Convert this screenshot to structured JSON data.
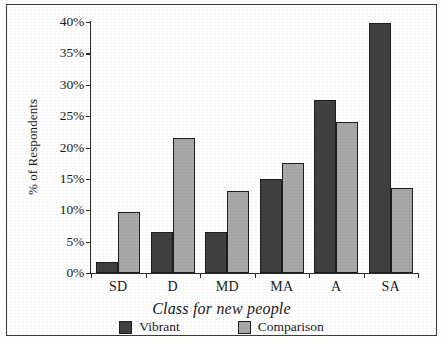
{
  "chart_data": {
    "type": "bar",
    "title": "",
    "xlabel": "Class for new people",
    "ylabel": "% of Respondents",
    "categories": [
      "SD",
      "D",
      "MD",
      "MA",
      "A",
      "SA"
    ],
    "series": [
      {
        "name": "Vibrant",
        "color": "#404040",
        "values": [
          1.8,
          6.5,
          6.5,
          15.0,
          27.6,
          39.8
        ]
      },
      {
        "name": "Comparison",
        "color": "#a8a8a8",
        "values": [
          9.7,
          21.5,
          13.0,
          17.5,
          24.1,
          13.6
        ]
      }
    ],
    "ylim": [
      0,
      40
    ],
    "ytick_values": [
      0,
      5,
      10,
      15,
      20,
      25,
      30,
      35,
      40
    ],
    "ytick_labels": [
      "0%",
      "5%",
      "10%",
      "15%",
      "20%",
      "25%",
      "30%",
      "35%",
      "40%"
    ],
    "grid": false,
    "legend_position": "bottom",
    "value_suffix": "%"
  },
  "legend": {
    "items": [
      {
        "label": "Vibrant",
        "swatch": "vibrant"
      },
      {
        "label": "Comparison",
        "swatch": "comparison"
      }
    ]
  },
  "axes": {
    "y_title": "% of Respondents",
    "x_title": "Class for new people"
  }
}
